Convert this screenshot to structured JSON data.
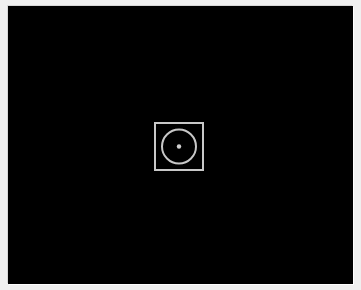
{
  "viewport": {
    "background": "#000000",
    "frame_color": "#f0f0f0"
  },
  "center_icon": {
    "icon": "capture-target-icon",
    "stroke_color": "#c8c8c8"
  }
}
